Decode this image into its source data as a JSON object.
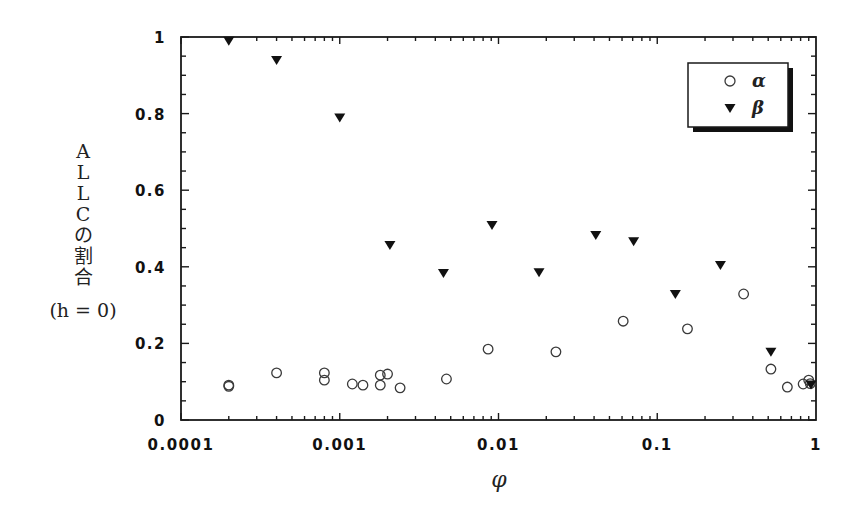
{
  "chart_data": {
    "type": "scatter",
    "title": "",
    "xlabel": "φ",
    "ylabel_lines": [
      "A",
      "L",
      "L",
      "C",
      "の",
      "割",
      "合"
    ],
    "ylabel_sub": "(h = 0)",
    "ylabel": "ALLCの割合 (h = 0)",
    "xscale": "log",
    "xlim": [
      0.0001,
      1
    ],
    "ylim": [
      0,
      1
    ],
    "x_ticks": [
      0.0001,
      0.001,
      0.01,
      0.1,
      1
    ],
    "x_tick_labels": [
      "0.0001",
      "0.001",
      "0.01",
      "0.1",
      "1"
    ],
    "y_ticks": [
      0,
      0.2,
      0.4,
      0.6,
      0.8,
      1
    ],
    "y_tick_labels": [
      "0",
      "0.2",
      "0.4",
      "0.6",
      "0.8",
      "1"
    ],
    "grid": false,
    "legend_position": "upper right",
    "series": [
      {
        "name": "α",
        "marker": "open-circle",
        "points": [
          [
            0.0002,
            0.091
          ],
          [
            0.0002,
            0.088
          ],
          [
            0.0004,
            0.123
          ],
          [
            0.0008,
            0.123
          ],
          [
            0.0008,
            0.104
          ],
          [
            0.0012,
            0.094
          ],
          [
            0.0014,
            0.091
          ],
          [
            0.0018,
            0.117
          ],
          [
            0.0018,
            0.091
          ],
          [
            0.002,
            0.12
          ],
          [
            0.0024,
            0.084
          ],
          [
            0.0047,
            0.107
          ],
          [
            0.0086,
            0.185
          ],
          [
            0.023,
            0.178
          ],
          [
            0.061,
            0.258
          ],
          [
            0.155,
            0.238
          ],
          [
            0.35,
            0.329
          ],
          [
            0.52,
            0.133
          ],
          [
            0.66,
            0.086
          ],
          [
            0.83,
            0.094
          ],
          [
            0.9,
            0.104
          ],
          [
            0.92,
            0.095
          ]
        ]
      },
      {
        "name": "β",
        "marker": "filled-down-triangle",
        "points": [
          [
            0.0002,
            0.99
          ],
          [
            0.0004,
            0.94
          ],
          [
            0.001,
            0.79
          ],
          [
            0.00207,
            0.457
          ],
          [
            0.0045,
            0.384
          ],
          [
            0.0091,
            0.509
          ],
          [
            0.018,
            0.386
          ],
          [
            0.041,
            0.483
          ],
          [
            0.071,
            0.467
          ],
          [
            0.13,
            0.329
          ],
          [
            0.25,
            0.405
          ],
          [
            0.52,
            0.178
          ],
          [
            0.93,
            0.093
          ]
        ]
      }
    ]
  },
  "legend": {
    "items": [
      {
        "label": "α",
        "marker": "open-circle"
      },
      {
        "label": "β",
        "marker": "filled-down-triangle"
      }
    ]
  },
  "colors": {
    "axis": "#1a1a1a",
    "marker_alpha_stroke": "#3a3a3a",
    "marker_beta_fill": "#111111",
    "background": "#ffffff"
  }
}
